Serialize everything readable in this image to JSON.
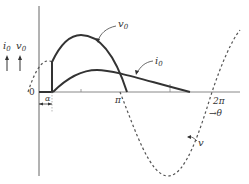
{
  "diagram": {
    "title": "",
    "labels": {
      "i0_axis": "i",
      "i0_sub": "0",
      "v0_axis": "v",
      "v0_sub": "0",
      "origin": "0",
      "alpha": "α",
      "pi": "π",
      "two_pi": "2π",
      "theta": "→θ",
      "curve_v0": "v",
      "curve_v0_sub": "0",
      "curve_i0": "i",
      "curve_i0_sub": "0",
      "curve_v": "v"
    },
    "curves": [
      {
        "name": "v",
        "style": "dashed",
        "description": "source voltage sine wave"
      },
      {
        "name": "v0",
        "style": "solid-bold",
        "description": "output voltage, starts at firing angle alpha"
      },
      {
        "name": "i0",
        "style": "solid-bold",
        "description": "output current, extends past pi"
      }
    ],
    "colors": {
      "line": "#333333",
      "axis": "#555555"
    }
  }
}
